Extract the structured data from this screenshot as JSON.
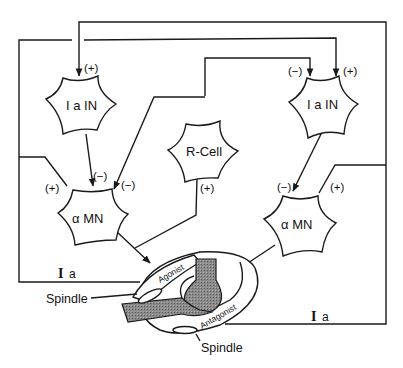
{
  "diagram": {
    "type": "neural-circuit",
    "cells": [
      {
        "id": "ia-in-left",
        "label": "I a IN"
      },
      {
        "id": "r-cell",
        "label": "R-Cell"
      },
      {
        "id": "ia-in-right",
        "label": "I a IN"
      },
      {
        "id": "alpha-mn-left",
        "label": "α MN"
      },
      {
        "id": "alpha-mn-right",
        "label": "α MN"
      }
    ],
    "signs": {
      "ia_in_left_input": "(+)",
      "ia_in_right_input_inhib": "(−)",
      "ia_in_right_input_excit": "(+)",
      "alpha_mn_left_excit": "(+)",
      "alpha_mn_left_inhib_from_ia": "(−)",
      "alpha_mn_left_inhib_from_rcell": "(−)",
      "rcell_input": "(+)",
      "alpha_mn_right_inhib": "(−)",
      "alpha_mn_right_excit": "(+)"
    },
    "afferents": {
      "left": "a",
      "right": "a",
      "roman": "I"
    },
    "muscle": {
      "agonist": "Agonist",
      "antagonist": "Antagonist",
      "spindle_top": "Spindle",
      "spindle_bottom": "Spindle"
    }
  }
}
